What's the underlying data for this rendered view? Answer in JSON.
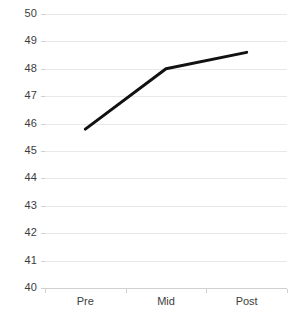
{
  "chart_data": {
    "type": "line",
    "title": "",
    "subtitle": "",
    "xlabel": "",
    "ylabel": "",
    "categories": [
      "Pre",
      "Mid",
      "Post"
    ],
    "series": [
      {
        "name": "",
        "values": [
          45.8,
          48.0,
          48.6
        ],
        "color": "#111111",
        "line_width": 3,
        "markers": false
      }
    ],
    "ylim": [
      40,
      50
    ],
    "yticks": [
      40,
      41,
      42,
      43,
      44,
      45,
      46,
      47,
      48,
      49,
      50
    ],
    "ytick_labels": [
      "40",
      "41",
      "42",
      "43",
      "44",
      "45",
      "46",
      "47",
      "48",
      "49",
      "50"
    ],
    "grid": {
      "horizontal": true,
      "vertical": false,
      "color": "#e8e8e8"
    },
    "legend": {
      "visible": false,
      "position": "none",
      "entries": []
    },
    "annotations": [],
    "background_color": "#ffffff",
    "axis_color": "#d0d0d0",
    "tick_label_color": "#3d3d3d"
  }
}
